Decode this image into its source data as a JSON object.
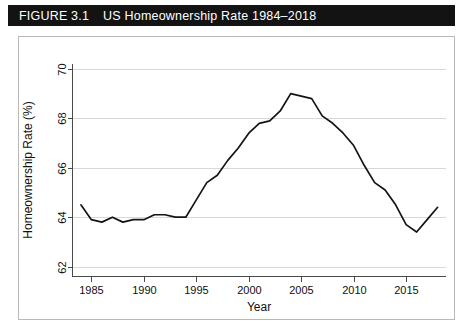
{
  "figure": {
    "label": "FIGURE 3.1",
    "caption": "US Homeownership Rate 1984–2018"
  },
  "chart_data": {
    "type": "line",
    "title": "US Homeownership Rate 1984–2018",
    "xlabel": "Year",
    "ylabel": "Homeownership Rate (%)",
    "xlim": [
      1983.2,
      2018.8
    ],
    "ylim": [
      61.6,
      70.2
    ],
    "xticks": [
      1985,
      1990,
      1995,
      2000,
      2005,
      2010,
      2015
    ],
    "xtick_labels": [
      "1985",
      "1990",
      "1995",
      "2000",
      "2005",
      "2010",
      "2015"
    ],
    "yticks": [
      62,
      64,
      66,
      68,
      70
    ],
    "ytick_labels": [
      "62",
      "64",
      "66",
      "68",
      "70"
    ],
    "grid": "horizontal",
    "legend": "none",
    "line_color": "#141414",
    "series": [
      {
        "name": "US Homeownership Rate",
        "x": [
          1984,
          1985,
          1986,
          1987,
          1988,
          1989,
          1990,
          1991,
          1992,
          1993,
          1994,
          1995,
          1996,
          1997,
          1998,
          1999,
          2000,
          2001,
          2002,
          2003,
          2004,
          2005,
          2006,
          2007,
          2008,
          2009,
          2010,
          2011,
          2012,
          2013,
          2014,
          2015,
          2016,
          2017,
          2018
        ],
        "values": [
          64.5,
          63.9,
          63.8,
          64.0,
          63.8,
          63.9,
          63.9,
          64.1,
          64.1,
          64.0,
          64.0,
          64.7,
          65.4,
          65.7,
          66.3,
          66.8,
          67.4,
          67.8,
          67.9,
          68.3,
          69.0,
          68.9,
          68.8,
          68.1,
          67.8,
          67.4,
          66.9,
          66.1,
          65.4,
          65.1,
          64.5,
          63.7,
          63.4,
          63.9,
          64.4
        ]
      }
    ]
  }
}
